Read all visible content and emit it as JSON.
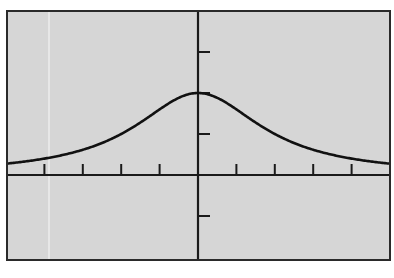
{
  "chart_data": {
    "type": "line",
    "title": "",
    "xlabel": "",
    "ylabel": "",
    "function": "y = 8 / (x^2 + 4)",
    "xlim": [
      -5,
      5
    ],
    "ylim": [
      -2,
      4
    ],
    "x_tick_step": 1,
    "y_tick_step": 1,
    "grid": false,
    "legend": null,
    "series": [
      {
        "name": "curve",
        "x": [
          -5,
          -4,
          -3,
          -2,
          -1,
          0,
          1,
          2,
          3,
          4,
          5
        ],
        "values": [
          0.28,
          0.4,
          0.62,
          1.0,
          1.6,
          2.0,
          1.6,
          1.0,
          0.62,
          0.4,
          0.28
        ]
      }
    ]
  },
  "style": {
    "background": "#d6d6d6",
    "frame_color": "#2a2a2a",
    "axis_color": "#1a1a1a",
    "curve_color": "#111111",
    "page_background": "#ffffff"
  },
  "layout": {
    "frame": {
      "left": 7,
      "top": 11,
      "right": 390,
      "bottom": 260
    },
    "origin_px": {
      "x": 198,
      "y": 175
    },
    "unit_px": {
      "x": 38.4,
      "y": 41
    }
  }
}
